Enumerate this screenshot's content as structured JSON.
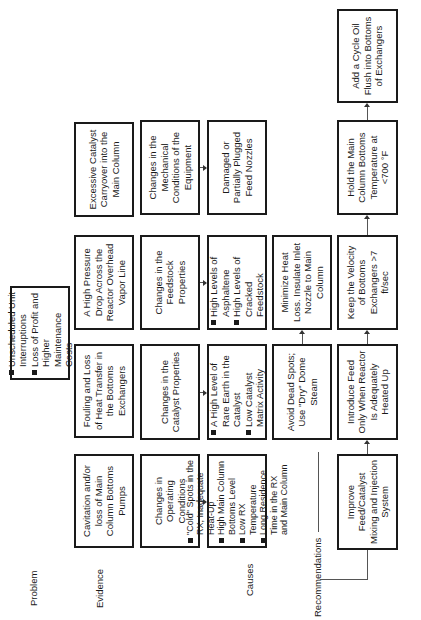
{
  "diagram": {
    "row_labels": {
      "problem": "Problem",
      "evidence": "Evidence",
      "causes": "Causes",
      "recommendations": "Recommendations"
    },
    "problem": {
      "items": [
        "Unscheduled Unit Interruptions",
        "Loss of Profit and Higher Maintenance Costs"
      ]
    },
    "evidence": [
      "Cavitation and/or loss of Main Column Bottoms Pumps",
      "Fouling and Loss of Heat Transfer in the Bottoms Exchangers",
      "A High Pressure Drop Across the Reactor Overhead Vapor Line",
      "Excessive Catalyst Carryover into the Main Column"
    ],
    "cause_categories": [
      "Changes in Operating Conditions",
      "Changes in the Catalyst Properties",
      "Changes in the Feedstock Properties",
      "Changes in the Mechanical Conditions of the Equipment"
    ],
    "cause_details": [
      {
        "items": [
          "\"Cold\" Spots in the RX, Inadequate Heat-Up",
          "High Main Column Bottoms Level",
          "Low RX Temperature",
          "Long Residence Time in the RX and Main Column"
        ]
      },
      {
        "items": [
          "A High Level of Rare Earth in the Catalyst",
          "Low Catalyst Matrix Activity"
        ]
      },
      {
        "items": [
          "High Levels of Asphaltene",
          "High Levels of Cracked Feedstock"
        ]
      },
      {
        "text": "Damaged or Partially Plugged Feed Nozzles"
      }
    ],
    "recommendations_upper": [
      "Avoid Dead Spots; Use \"Dry\" Dome Steam",
      "Minimize Heat Loss. Insulate Inlet Nozzle to Main Column"
    ],
    "recommendations_lower": [
      "Improve Feed/Catalyst Mixing and Injection System",
      "Introduce Feed Only When Reactor Is Adequately Heated Up",
      "Keep the Velocity of Bottoms Exchangers >7 ft/sec",
      "Hold the Main Column Bottoms Temperature at <700 °F",
      "Add a Cycle Oil Flush into Bottoms of Exchangers"
    ]
  }
}
